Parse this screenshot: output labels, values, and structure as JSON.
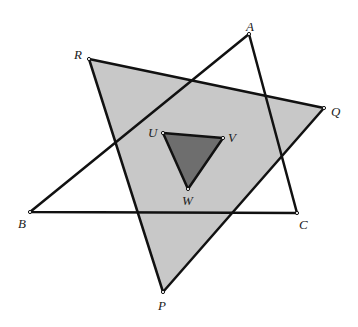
{
  "diagram": {
    "colors": {
      "pqr_fill": "#c8c8c8",
      "uvw_fill": "#6e6e6e",
      "stroke": "#111111"
    },
    "points": {
      "A": [
        249,
        34
      ],
      "B": [
        30,
        212
      ],
      "C": [
        297,
        213
      ],
      "P": [
        163,
        292
      ],
      "Q": [
        324,
        108
      ],
      "R": [
        89,
        59
      ],
      "U": [
        163,
        133
      ],
      "V": [
        223,
        138
      ],
      "W": [
        188,
        189
      ]
    },
    "labels": {
      "A": "A",
      "B": "B",
      "C": "C",
      "P": "P",
      "Q": "Q",
      "R": "R",
      "U": "U",
      "V": "V",
      "W": "W"
    },
    "triangles": [
      {
        "name": "PQR",
        "vertices": [
          "P",
          "Q",
          "R"
        ],
        "filled": true
      },
      {
        "name": "ABC",
        "vertices": [
          "A",
          "B",
          "C"
        ],
        "filled": false
      },
      {
        "name": "UVW",
        "vertices": [
          "U",
          "V",
          "W"
        ],
        "filled": true
      }
    ]
  }
}
